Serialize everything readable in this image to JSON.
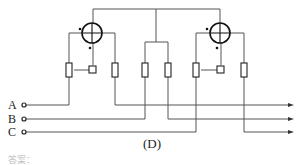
{
  "diagram": {
    "caption": "(D)",
    "footer_text": "答案：",
    "terminals": [
      {
        "label": "A",
        "y": 105
      },
      {
        "label": "B",
        "y": 119
      },
      {
        "label": "C",
        "y": 132
      }
    ],
    "meters": [
      {
        "name": "left-wattmeter",
        "cx": 92,
        "cy": 33,
        "r": 10
      },
      {
        "name": "right-wattmeter",
        "cx": 220,
        "cy": 33,
        "r": 10
      }
    ],
    "resistors_x": [
      69,
      115,
      145,
      168,
      196,
      244
    ],
    "colors": {
      "line": "#555555",
      "symbol": "#222222",
      "text": "#222222"
    }
  }
}
